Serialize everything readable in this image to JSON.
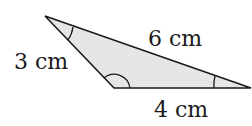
{
  "diagram": {
    "type": "triangle",
    "fill_color": "#e6e6e6",
    "stroke_color": "#1a1a1a",
    "vertices": {
      "top_left": [
        45,
        16
      ],
      "bottom_left": [
        114,
        88
      ],
      "right": [
        251,
        88
      ]
    },
    "sides": [
      {
        "id": "left",
        "label": "3 cm"
      },
      {
        "id": "top",
        "label": "6 cm"
      },
      {
        "id": "bottom",
        "label": "4 cm"
      }
    ],
    "angle_marks": [
      "top-left-vertex",
      "bottom-left-obtuse-vertex",
      "right-vertex"
    ]
  }
}
